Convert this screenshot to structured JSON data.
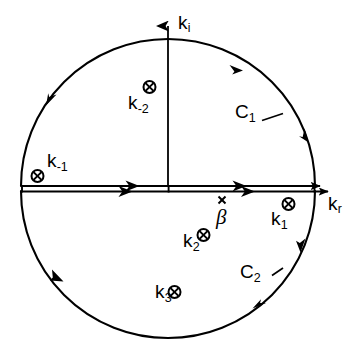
{
  "figure": {
    "kind": "complex-plane-contour-integration-diagram",
    "background_color": "#ffffff",
    "line_color": "#000000",
    "width": 360,
    "height": 345
  },
  "axes": {
    "imaginary": {
      "label": "k",
      "subscript": "i",
      "full_label": "k_i",
      "direction": "up",
      "name": "imaginary-axis"
    },
    "real": {
      "label": "k",
      "subscript": "r",
      "full_label": "k_r",
      "direction": "right",
      "name": "real-axis"
    }
  },
  "contours": [
    {
      "label": "C",
      "subscript": "1",
      "full_label": "C_1",
      "region": "upper-half-plane",
      "orientation": "counterclockwise"
    },
    {
      "label": "C",
      "subscript": "2",
      "full_label": "C_2",
      "region": "lower-half-plane",
      "orientation": "clockwise"
    }
  ],
  "poles": [
    {
      "label": "k",
      "subscript": "-1",
      "full_label": "k_-1",
      "marker": "circle-cross",
      "quadrant": "upper-left"
    },
    {
      "label": "k",
      "subscript": "-2",
      "full_label": "k_-2",
      "marker": "circle-cross",
      "quadrant": "upper-left"
    },
    {
      "label": "k",
      "subscript": "1",
      "full_label": "k_1",
      "marker": "circle-cross",
      "quadrant": "lower-right"
    },
    {
      "label": "k",
      "subscript": "2",
      "full_label": "k_2",
      "marker": "circle-cross",
      "quadrant": "lower-right"
    },
    {
      "label": "k",
      "subscript": "3",
      "full_label": "k_3",
      "marker": "circle-cross",
      "quadrant": "lower-middle"
    }
  ],
  "branch_point": {
    "label": "β",
    "full_label": "beta",
    "marker": "cross"
  },
  "branch_cut": {
    "description": "double line along positive and negative real axis",
    "arrow_direction": "rightward"
  }
}
